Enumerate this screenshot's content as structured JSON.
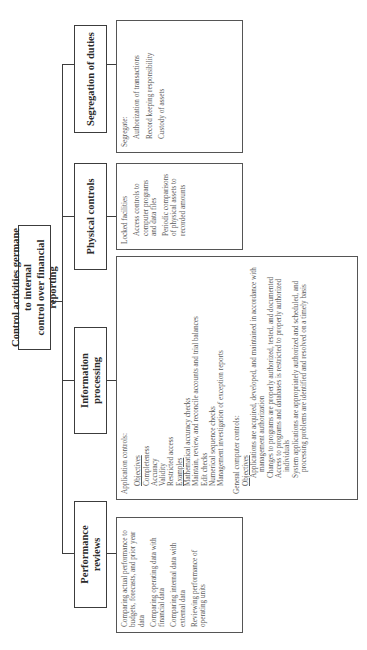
{
  "diagram": {
    "orientation": "rotated-90-ccw",
    "root": {
      "line1": "Control activities germane to internal",
      "line2": "control over financial reporting"
    },
    "categories": [
      {
        "id": "performance",
        "title_line1": "Performance",
        "title_line2": "reviews",
        "items": [
          "Comparing actual performance to budgets, forecasts, and prior year data",
          "Comparing operating data with financial data",
          "Comparing internal data with external data",
          "Reviewing performance of operating units"
        ]
      },
      {
        "id": "information",
        "title_line1": "Information",
        "title_line2": "processing",
        "application_controls": {
          "label": "Application controls:",
          "objectives_label": "Objectives",
          "objectives": [
            "Completeness",
            "Accuracy",
            "Validity",
            "Restricted access"
          ],
          "examples_label": "Examples",
          "examples": [
            "Mathematical accuracy checks",
            "Maintain, review, and reconcile accounts and trial balances",
            "Edit checks",
            "Numerical sequence checks",
            "Management investigation of exception reports"
          ]
        },
        "general_controls": {
          "label": "General computer controls:",
          "objectives_label": "Objectives",
          "objectives": [
            "Applications are acquired, developed, and maintained in accordance with management authorization",
            "Changes to programs are properly authorized, tested, and documented",
            "Access to programs and databases is restricted to properly authorized individuals",
            "System applications are appropriately authorized and scheduled, and processing problems are identified and resolved on a timely basis"
          ]
        }
      },
      {
        "id": "physical",
        "title": "Physical controls",
        "items": [
          "Locked facilities",
          "Access controls to computer programs and data files",
          "Periodic comparisons of physical assets to recorded amounts"
        ]
      },
      {
        "id": "segregation",
        "title": "Segregation of duties",
        "intro": "Segregate:",
        "items": [
          "Authorization of transactions",
          "Record keeping responsibility",
          "Custody of assets"
        ]
      }
    ]
  },
  "colors": {
    "border": "#3c3c3c",
    "text": "#3a3a3a",
    "background": "#ffffff"
  }
}
